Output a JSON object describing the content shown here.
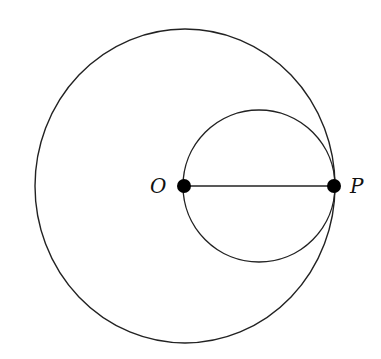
{
  "diagram": {
    "type": "geometry",
    "points": [
      {
        "label": "O",
        "role": "center of large circle"
      },
      {
        "label": "P",
        "role": "point on large circle, tangency point"
      }
    ],
    "segments": [
      {
        "from": "O",
        "to": "P"
      }
    ],
    "circles": [
      {
        "name": "large",
        "center": "O",
        "radius": "OP"
      },
      {
        "name": "small",
        "diameter": "OP"
      }
    ],
    "colors": {
      "stroke": "#222222",
      "point": "#000000",
      "background": "#ffffff"
    }
  }
}
